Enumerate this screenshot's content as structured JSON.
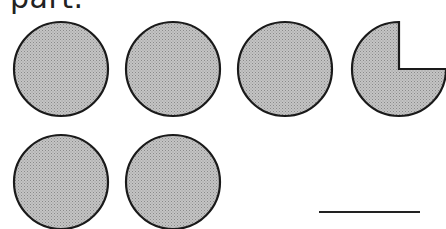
{
  "heading": {
    "text": "part."
  },
  "figure": {
    "fill_color": "#b8b8b8",
    "stroke_color": "#1a1a1a",
    "shapes": [
      {
        "name": "circle-1",
        "type": "full",
        "cx": 61,
        "cy": 69,
        "r": 47
      },
      {
        "name": "circle-2",
        "type": "full",
        "cx": 173,
        "cy": 69,
        "r": 47
      },
      {
        "name": "circle-3",
        "type": "full",
        "cx": 285,
        "cy": 69,
        "r": 47
      },
      {
        "name": "circle-4",
        "type": "three-quarter",
        "cx": 399,
        "cy": 69,
        "r": 47
      },
      {
        "name": "circle-5",
        "type": "full",
        "cx": 61,
        "cy": 182,
        "r": 47
      },
      {
        "name": "circle-6",
        "type": "full",
        "cx": 173,
        "cy": 182,
        "r": 47
      }
    ]
  },
  "answer": {
    "value": ""
  }
}
